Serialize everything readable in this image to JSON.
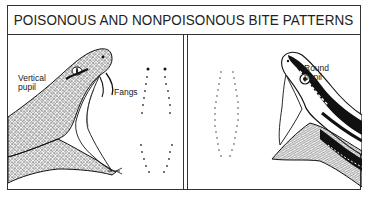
{
  "title": "POISONOUS AND NONPOISONOUS BITE PATTERNS",
  "panels": [
    {
      "id": "poisonous",
      "illustration": "venomous-snake-head-open-mouth",
      "labels": {
        "pupil_line1": "Vertical",
        "pupil_line2": "pupil",
        "fangs": "Fangs"
      },
      "bite_pattern": "two rows of teeth marks with fang punctures at top"
    },
    {
      "id": "nonpoisonous",
      "illustration": "nonvenomous-snake-head-open-mouth",
      "labels": {
        "pupil_line1": "Round",
        "pupil_line2": "pupil"
      },
      "bite_pattern": "U-shaped row of small teeth marks, no fangs"
    }
  ],
  "colors": {
    "ink": "#1a1a1a",
    "background": "#ffffff",
    "border": "#333333"
  }
}
